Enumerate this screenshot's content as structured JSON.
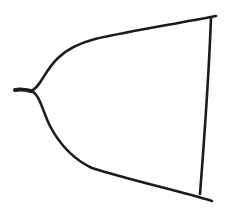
{
  "canvas": {
    "width": 229,
    "height": 214,
    "background": "#ffffff",
    "stroke_color": "#1c1c1c"
  },
  "sketch": {
    "description": "Hand-drawn outline shape: a narrow stem on the left that splits into two curves flaring out to a vertical line on the right",
    "strokes": [
      {
        "name": "stem-stroke",
        "d": "M 15 90 C 20 89, 27 90, 31 91",
        "width": 4
      },
      {
        "name": "upper-curve",
        "d": "M 31 91 C 40 88, 45 70, 58 58 C 68 48, 80 43, 95 39 C 130 31, 175 24, 216 16",
        "width": 2.6
      },
      {
        "name": "lower-curve",
        "d": "M 31 91 C 40 94, 42 110, 50 126 C 60 145, 75 160, 92 168 C 130 180, 175 190, 212 201",
        "width": 2.6
      },
      {
        "name": "right-edge-line",
        "d": "M 211 18 C 209 70, 205 130, 200 194",
        "width": 2.6
      }
    ]
  }
}
